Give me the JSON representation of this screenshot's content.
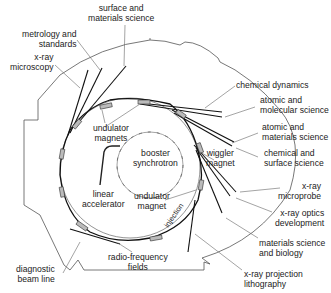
{
  "diagram": {
    "colors": {
      "line": "#444444",
      "beam": "#111111",
      "magnet_fill": "#bbbbbb",
      "text": "#222222",
      "background": "#ffffff"
    },
    "labels": {
      "surface_materials": [
        "surface and",
        "materials science"
      ],
      "metrology": [
        "metrology and",
        "standards"
      ],
      "xray_microscopy": [
        "x-ray",
        "microscopy"
      ],
      "chemical_dynamics": [
        "chemical dynamics"
      ],
      "atomic_molecular": [
        "atomic and",
        "molecular science"
      ],
      "atomic_materials": [
        "atomic and",
        "materials science"
      ],
      "chemical_surface": [
        "chemical and",
        "surface science"
      ],
      "wiggler": [
        "wiggler",
        "magnet"
      ],
      "undulator_magnets": [
        "undulator",
        "magnets"
      ],
      "booster": [
        "booster",
        "synchrotron"
      ],
      "linac": [
        "linear",
        "accelerator"
      ],
      "undulator_magnet": [
        "undulator",
        "magnet"
      ],
      "xray_microprobe": [
        "x-ray",
        "microprobe"
      ],
      "xray_optics": [
        "x-ray optics",
        "development"
      ],
      "materials_biology": [
        "materials science",
        "and biology"
      ],
      "xray_projection": [
        "x-ray projection",
        "lithography"
      ],
      "rf_fields": [
        "radio-frequency",
        "fields"
      ],
      "diagnostic": [
        "diagnostic",
        "beam line"
      ],
      "injection": "injection"
    }
  }
}
